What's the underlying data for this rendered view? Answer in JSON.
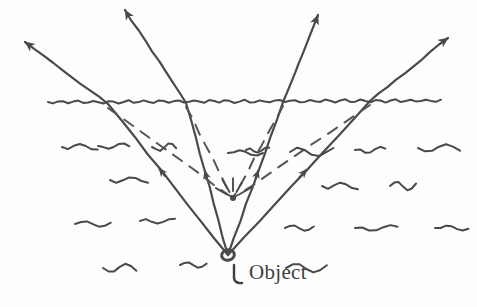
{
  "figure": {
    "labels": {
      "object": "Object"
    },
    "colors": {
      "ink": "#4a4a4a",
      "ink_dark": "#3f3f3f",
      "background": "#fdfdfc",
      "dashed_ray": "#555555"
    }
  },
  "scene": {
    "object_point": {
      "x": 228,
      "y": 255,
      "name": "object-point"
    },
    "virtual_image_point": {
      "x": 233,
      "y": 198,
      "name": "virtual-image-point"
    },
    "water_surface": {
      "name": "water-surface-line",
      "y": 102,
      "x_start": 48,
      "x_end": 441,
      "style": "wavy"
    },
    "rays": [
      {
        "name": "ray-1",
        "surface_hit": {
          "x": 108,
          "y": 104
        },
        "tip": {
          "x": 25,
          "y": 42
        },
        "mid_arrow_t": 0.52
      },
      {
        "name": "ray-2",
        "surface_hit": {
          "x": 186,
          "y": 103
        },
        "tip": {
          "x": 125,
          "y": 10
        },
        "mid_arrow_t": 0.5
      },
      {
        "name": "ray-3",
        "surface_hit": {
          "x": 283,
          "y": 102
        },
        "tip": {
          "x": 318,
          "y": 15
        },
        "mid_arrow_t": 0.5
      },
      {
        "name": "ray-4",
        "surface_hit": {
          "x": 370,
          "y": 101
        },
        "tip": {
          "x": 448,
          "y": 38
        },
        "mid_arrow_t": 0.5
      }
    ],
    "dashed_back_projections": [
      {
        "name": "dashed-ray-1",
        "from": {
          "x": 108,
          "y": 104
        },
        "to": {
          "x": 233,
          "y": 198
        }
      },
      {
        "name": "dashed-ray-2",
        "from": {
          "x": 186,
          "y": 103
        },
        "to": {
          "x": 233,
          "y": 198
        }
      },
      {
        "name": "dashed-ray-3",
        "from": {
          "x": 283,
          "y": 102
        },
        "to": {
          "x": 233,
          "y": 198
        }
      },
      {
        "name": "dashed-ray-4",
        "from": {
          "x": 370,
          "y": 101
        },
        "to": {
          "x": 233,
          "y": 198
        }
      }
    ],
    "image_sparkle_rays": 5,
    "object_sparkle_rays": 5,
    "water_ripples": [
      {
        "x": 62,
        "y": 147
      },
      {
        "x": 98,
        "y": 146
      },
      {
        "x": 110,
        "y": 180
      },
      {
        "x": 152,
        "y": 147
      },
      {
        "x": 75,
        "y": 224
      },
      {
        "x": 140,
        "y": 221
      },
      {
        "x": 103,
        "y": 268
      },
      {
        "x": 180,
        "y": 265
      },
      {
        "x": 228,
        "y": 153
      },
      {
        "x": 246,
        "y": 150
      },
      {
        "x": 290,
        "y": 152
      },
      {
        "x": 355,
        "y": 150
      },
      {
        "x": 418,
        "y": 148
      },
      {
        "x": 322,
        "y": 186
      },
      {
        "x": 390,
        "y": 186
      },
      {
        "x": 285,
        "y": 228
      },
      {
        "x": 355,
        "y": 228
      },
      {
        "x": 435,
        "y": 228
      },
      {
        "x": 286,
        "y": 268
      }
    ]
  }
}
